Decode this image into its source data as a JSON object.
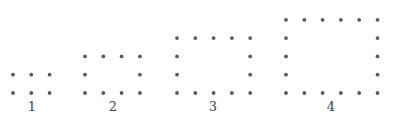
{
  "dot_color": "#5a5a5a",
  "figures": [
    {
      "label": "1",
      "columns": 3,
      "rows": 2
    },
    {
      "label": "2",
      "columns": 4,
      "rows": 3
    },
    {
      "label": "3",
      "columns": 5,
      "rows": 4
    },
    {
      "label": "4",
      "columns": 6,
      "rows": 5
    }
  ]
}
